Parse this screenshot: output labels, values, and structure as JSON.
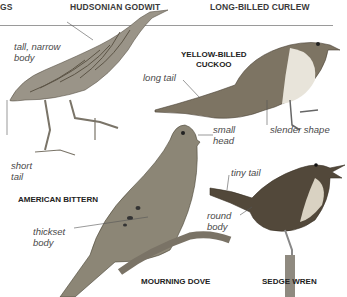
{
  "header": {
    "columns": [
      "GS",
      "HUDSONIAN GODWIT",
      "LONG-BILLED CURLEW"
    ]
  },
  "birds": [
    {
      "name": "AMERICAN BITTERN",
      "labels": [
        "tall, narrow body",
        "short tail"
      ]
    },
    {
      "name_line1": "YELLOW-BILLED",
      "name_line2": "CUCKOO",
      "labels": [
        "long tail",
        "slender shape"
      ]
    },
    {
      "name": "MOURNING DOVE",
      "labels": [
        "small head",
        "thickset body"
      ]
    },
    {
      "name": "SEDGE WREN",
      "labels": [
        "tiny tail",
        "round body"
      ]
    }
  ],
  "labels": {
    "tall_narrow_1": "tall, narrow",
    "tall_narrow_2": "body",
    "short_tail_1": "short",
    "short_tail_2": "tail",
    "long_tail": "long tail",
    "slender_shape": "slender shape",
    "small_head_1": "small",
    "small_head_2": "head",
    "thickset_1": "thickset",
    "thickset_2": "body",
    "tiny_tail": "tiny tail",
    "round_body_1": "round",
    "round_body_2": "body"
  },
  "names": {
    "bittern": "AMERICAN BITTERN",
    "cuckoo_1": "YELLOW-BILLED",
    "cuckoo_2": "CUCKOO",
    "dove": "MOURNING DOVE",
    "wren": "SEDGE WREN"
  }
}
